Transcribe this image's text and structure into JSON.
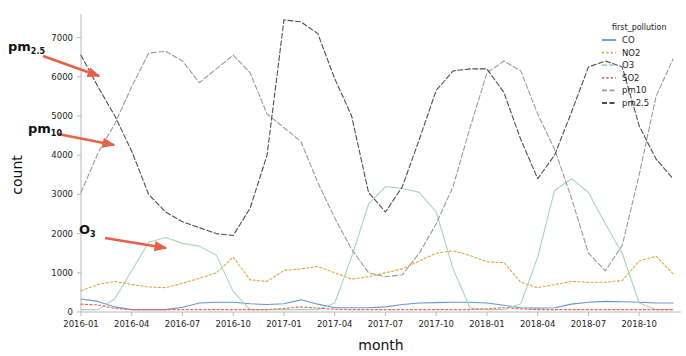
{
  "chart_data": {
    "type": "line",
    "title": "",
    "xlabel": "month",
    "ylabel": "count",
    "ylim": [
      0,
      7600
    ],
    "yticks": [
      0,
      1000,
      2000,
      3000,
      4000,
      5000,
      6000,
      7000
    ],
    "ytick_labels": [
      "0",
      "1000",
      "2000",
      "3000",
      "4000",
      "5000",
      "6000",
      "7000"
    ],
    "xtick_labels": [
      "2016-01",
      "2016-04",
      "2016-07",
      "2016-10",
      "2017-01",
      "2017-04",
      "2017-07",
      "2017-10",
      "2018-01",
      "2018-04",
      "2018-07",
      "2018-10"
    ],
    "xtick_months": [
      "2016-01",
      "2016-04",
      "2016-07",
      "2016-10",
      "2017-01",
      "2017-04",
      "2017-07",
      "2017-10",
      "2018-01",
      "2018-04",
      "2018-07",
      "2018-10"
    ],
    "grid": false,
    "legend_position": "upper right",
    "legend_title": "first_pollution",
    "x": [
      "2016-01",
      "2016-02",
      "2016-03",
      "2016-04",
      "2016-05",
      "2016-06",
      "2016-07",
      "2016-08",
      "2016-09",
      "2016-10",
      "2016-11",
      "2016-12",
      "2017-01",
      "2017-02",
      "2017-03",
      "2017-04",
      "2017-05",
      "2017-06",
      "2017-07",
      "2017-08",
      "2017-09",
      "2017-10",
      "2017-11",
      "2017-12",
      "2018-01",
      "2018-02",
      "2018-03",
      "2018-04",
      "2018-05",
      "2018-06",
      "2018-07",
      "2018-08",
      "2018-09",
      "2018-10",
      "2018-11",
      "2018-12"
    ],
    "series": [
      {
        "name": "CO",
        "color": "#6699cc",
        "dash": "none",
        "values": [
          330,
          270,
          130,
          60,
          60,
          60,
          120,
          230,
          250,
          250,
          210,
          190,
          210,
          310,
          200,
          110,
          110,
          110,
          130,
          190,
          230,
          240,
          250,
          250,
          230,
          170,
          110,
          100,
          110,
          200,
          250,
          270,
          260,
          250,
          230,
          230
        ]
      },
      {
        "name": "NO2",
        "color": "#e8a33d",
        "dash": "dotted",
        "values": [
          540,
          700,
          780,
          700,
          640,
          620,
          730,
          860,
          1000,
          1400,
          820,
          780,
          1060,
          1100,
          1160,
          1000,
          840,
          900,
          1000,
          1100,
          1300,
          1500,
          1560,
          1440,
          1280,
          1260,
          760,
          620,
          700,
          780,
          760,
          760,
          800,
          1300,
          1420,
          980
        ]
      },
      {
        "name": "O3",
        "color": "#a8d5ba",
        "dash": "none",
        "values": [
          60,
          60,
          340,
          1050,
          1780,
          1900,
          1750,
          1680,
          1450,
          520,
          60,
          60,
          60,
          60,
          60,
          230,
          1400,
          2750,
          3200,
          3150,
          3050,
          2550,
          1100,
          100,
          60,
          60,
          210,
          1400,
          3100,
          3400,
          3050,
          2250,
          1500,
          230,
          60,
          60
        ]
      },
      {
        "name": "SO2",
        "color": "#e8675a",
        "dash": "dotted",
        "values": [
          200,
          180,
          90,
          60,
          60,
          60,
          60,
          60,
          60,
          60,
          60,
          60,
          90,
          130,
          100,
          70,
          60,
          60,
          60,
          60,
          60,
          60,
          60,
          60,
          80,
          110,
          80,
          60,
          60,
          60,
          60,
          60,
          60,
          60,
          60,
          60
        ]
      },
      {
        "name": "pm10",
        "color": "#9a9a9a",
        "dash": "dashed",
        "values": [
          3050,
          4050,
          4800,
          5750,
          6600,
          6650,
          6400,
          5850,
          6200,
          6550,
          6100,
          5050,
          4700,
          4350,
          3300,
          2400,
          1600,
          1000,
          900,
          950,
          1500,
          2250,
          3200,
          4700,
          6100,
          6400,
          6150,
          5050,
          4150,
          2900,
          1500,
          1050,
          1700,
          3500,
          5500,
          6450
        ]
      },
      {
        "name": "pm2.5",
        "color": "#4d4d4d",
        "dash": "dashed",
        "values": [
          6550,
          5750,
          5000,
          4100,
          3000,
          2550,
          2300,
          2150,
          2000,
          1950,
          2650,
          4000,
          7450,
          7400,
          7100,
          5950,
          5000,
          3050,
          2550,
          3200,
          4400,
          5650,
          6150,
          6200,
          6200,
          5600,
          4400,
          3400,
          4000,
          5100,
          6250,
          6400,
          6250,
          4750,
          3900,
          3400
        ]
      }
    ],
    "annotations": [
      {
        "id": "pm25-annotation",
        "text": "pm",
        "sub": "2.5",
        "text_x": 8,
        "text_y": 51,
        "arrow_x1": 43,
        "arrow_y1": 56,
        "arrow_x2": 99,
        "arrow_y2": 76,
        "color": "#e8604a"
      },
      {
        "id": "pm10-annotation",
        "text": "pm",
        "sub": "10",
        "text_x": 28,
        "text_y": 133,
        "arrow_x1": 58,
        "arrow_y1": 134,
        "arrow_x2": 114,
        "arrow_y2": 145,
        "color": "#e8604a"
      },
      {
        "id": "o3-annotation",
        "text": "O",
        "sub": "3",
        "text_x": 79,
        "text_y": 234,
        "arrow_x1": 105,
        "arrow_y1": 238,
        "arrow_x2": 166,
        "arrow_y2": 248,
        "color": "#e8604a"
      }
    ]
  },
  "legend": {
    "title": "first_pollution",
    "items": [
      {
        "label": "CO",
        "color": "#6699cc"
      },
      {
        "label": "NO2",
        "color": "#e8a33d"
      },
      {
        "label": "O3",
        "color": "#a8d5ba"
      },
      {
        "label": "SO2",
        "color": "#e8675a"
      },
      {
        "label": "pm10",
        "color": "#9a9a9a"
      },
      {
        "label": "pm2.5",
        "color": "#4d4d4d"
      }
    ]
  },
  "axes": {
    "x_title": "month",
    "y_title": "count"
  }
}
